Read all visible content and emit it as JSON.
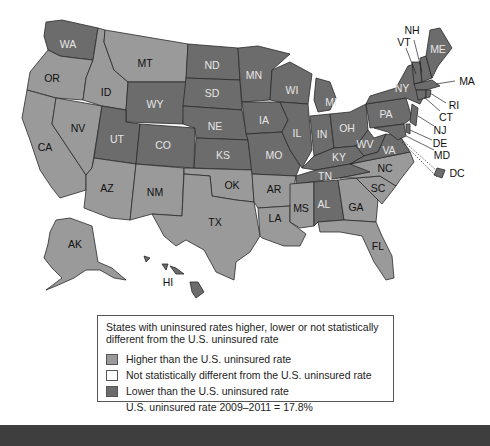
{
  "map": {
    "labels": {
      "WA": "WA",
      "OR": "OR",
      "CA": "CA",
      "NV": "NV",
      "ID": "ID",
      "MT": "MT",
      "WY": "WY",
      "UT": "UT",
      "AZ": "AZ",
      "CO": "CO",
      "NM": "NM",
      "ND": "ND",
      "SD": "SD",
      "NE": "NE",
      "KS": "KS",
      "OK": "OK",
      "TX": "TX",
      "MN": "MN",
      "IA": "IA",
      "MO": "MO",
      "AR": "AR",
      "LA": "LA",
      "WI": "WI",
      "IL": "IL",
      "MI": "MI",
      "IN": "IN",
      "OH": "OH",
      "KY": "KY",
      "TN": "TN",
      "MS": "MS",
      "AL": "AL",
      "GA": "GA",
      "FL": "FL",
      "SC": "SC",
      "NC": "NC",
      "VA": "VA",
      "WV": "WV",
      "PA": "PA",
      "NY": "NY",
      "ME": "ME",
      "NH": "NH",
      "VT": "VT",
      "MA": "MA",
      "RI": "RI",
      "CT": "CT",
      "NJ": "NJ",
      "DE": "DE",
      "MD": "MD",
      "DC": "DC",
      "AK": "AK",
      "HI": "HI"
    },
    "categories": {
      "higher": [
        "OR",
        "CA",
        "NV",
        "ID",
        "MT",
        "AZ",
        "NM",
        "OK",
        "TX",
        "AR",
        "LA",
        "MS",
        "GA",
        "FL",
        "SC",
        "NC",
        "AK"
      ],
      "lower": [
        "WA",
        "WY",
        "UT",
        "CO",
        "ND",
        "SD",
        "NE",
        "KS",
        "MN",
        "IA",
        "MO",
        "WI",
        "IL",
        "MI",
        "IN",
        "OH",
        "KY",
        "TN",
        "AL",
        "VA",
        "WV",
        "PA",
        "NY",
        "ME",
        "NH",
        "VT",
        "MA",
        "RI",
        "CT",
        "NJ",
        "DE",
        "MD",
        "DC",
        "HI"
      ],
      "not_different": []
    },
    "colors": {
      "higher": "#9a9a9a",
      "lower": "#6c6c6c",
      "not_different": "#ffffff"
    }
  },
  "legend": {
    "title": "States with uninsured rates higher, lower or not statistically different from the U.S. uninsured rate",
    "items": [
      {
        "label": "Higher than the U.S. uninsured rate",
        "color": "#9a9a9a"
      },
      {
        "label": "Not statistically different from the U.S. uninsured rate",
        "color": "#ffffff"
      },
      {
        "label": "Lower than the U.S. uninsured rate",
        "color": "#6c6c6c"
      }
    ],
    "note": "U.S. uninsured rate 2009–2011 = 17.8%"
  }
}
